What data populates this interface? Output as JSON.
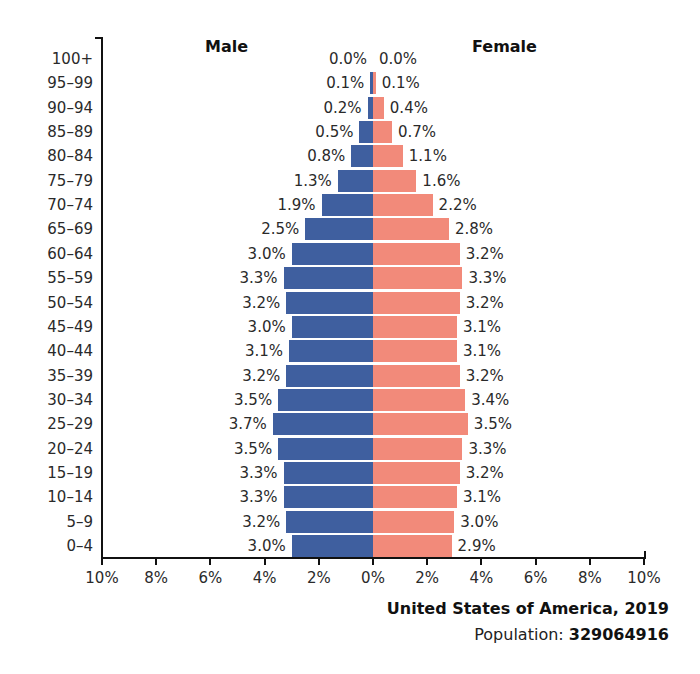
{
  "chart_data": {
    "type": "bar",
    "subtype": "population-pyramid",
    "title": "United States of America, 2019",
    "subtitle": "Population: 329064916",
    "population_label": "Population:",
    "population_value": "329064916",
    "xlabel": "",
    "ylabel": "",
    "xlim": [
      -10,
      10
    ],
    "x_tick_labels": [
      "10%",
      "8%",
      "6%",
      "4%",
      "2%",
      "0%",
      "2%",
      "4%",
      "6%",
      "8%",
      "10%"
    ],
    "x_ticks": [
      -10,
      -8,
      -6,
      -4,
      -2,
      0,
      2,
      4,
      6,
      8,
      10
    ],
    "grid": false,
    "legend": {
      "male_label": "Male",
      "female_label": "Female",
      "position": "top"
    },
    "colors": {
      "male": "#3f5f9f",
      "female": "#f28a7a"
    },
    "categories": [
      "100+",
      "95–99",
      "90–94",
      "85–89",
      "80–84",
      "75–79",
      "70–74",
      "65–69",
      "60–64",
      "55–59",
      "50–54",
      "45–49",
      "40–44",
      "35–39",
      "30–34",
      "25–29",
      "20–24",
      "15–19",
      "10–14",
      "5–9",
      "0–4"
    ],
    "series": [
      {
        "name": "Male",
        "values": [
          0.0,
          0.1,
          0.2,
          0.5,
          0.8,
          1.3,
          1.9,
          2.5,
          3.0,
          3.3,
          3.2,
          3.0,
          3.1,
          3.2,
          3.5,
          3.7,
          3.5,
          3.3,
          3.3,
          3.2,
          3.0
        ],
        "labels": [
          "0.0%",
          "0.1%",
          "0.2%",
          "0.5%",
          "0.8%",
          "1.3%",
          "1.9%",
          "2.5%",
          "3.0%",
          "3.3%",
          "3.2%",
          "3.0%",
          "3.1%",
          "3.2%",
          "3.5%",
          "3.7%",
          "3.5%",
          "3.3%",
          "3.3%",
          "3.2%",
          "3.0%"
        ]
      },
      {
        "name": "Female",
        "values": [
          0.0,
          0.1,
          0.4,
          0.7,
          1.1,
          1.6,
          2.2,
          2.8,
          3.2,
          3.3,
          3.2,
          3.1,
          3.1,
          3.2,
          3.4,
          3.5,
          3.3,
          3.2,
          3.1,
          3.0,
          2.9
        ],
        "labels": [
          "0.0%",
          "0.1%",
          "0.4%",
          "0.7%",
          "1.1%",
          "1.6%",
          "2.2%",
          "2.8%",
          "3.2%",
          "3.3%",
          "3.2%",
          "3.1%",
          "3.1%",
          "3.2%",
          "3.4%",
          "3.5%",
          "3.3%",
          "3.2%",
          "3.1%",
          "3.0%",
          "2.9%"
        ]
      }
    ]
  }
}
